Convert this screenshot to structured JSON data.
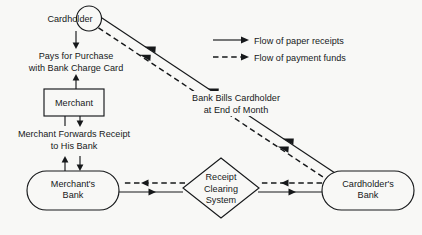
{
  "diagram": {
    "background_color": "#f8f8f6",
    "ink_color": "#16181a",
    "nodes": {
      "cardholder": {
        "label": "Cardholder",
        "shape": "circle"
      },
      "merchant": {
        "label": "Merchant",
        "shape": "rectangle"
      },
      "merchants_bank": {
        "label_line1": "Merchant's",
        "label_line2": "Bank",
        "shape": "stadium"
      },
      "clearing_system": {
        "label_line1": "Receipt",
        "label_line2": "Clearing",
        "label_line3": "System",
        "shape": "diamond"
      },
      "cardholders_bank": {
        "label_line1": "Cardholder's",
        "label_line2": "Bank",
        "shape": "stadium"
      }
    },
    "edge_labels": {
      "pays_for_purchase_line1": "Pays for Purchase",
      "pays_for_purchase_line2": "with Bank Charge Card",
      "merchant_forwards_line1": "Merchant Forwards Receipt",
      "merchant_forwards_line2": "to His Bank",
      "bank_bills_line1": "Bank Bills Cardholder",
      "bank_bills_line2": "at End of Month"
    },
    "legend": {
      "items": [
        {
          "style": "solid",
          "label": "Flow of paper receipts"
        },
        {
          "style": "dashed",
          "label": "Flow of payment funds"
        }
      ]
    }
  }
}
